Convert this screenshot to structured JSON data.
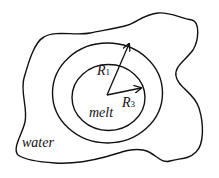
{
  "diagram": {
    "regions": {
      "outer": "water",
      "inner": "melt"
    },
    "radii": [
      {
        "symbol": "R",
        "subscript": "1"
      },
      {
        "symbol": "R",
        "subscript": "3"
      }
    ],
    "colors": {
      "stroke": "#111111",
      "background": "#ffffff"
    }
  }
}
